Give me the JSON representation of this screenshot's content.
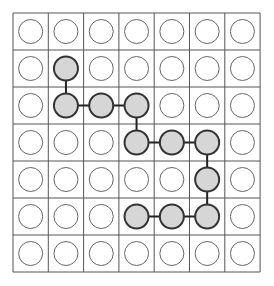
{
  "grid": {
    "rows": 7,
    "cols": 7,
    "origin_x": 13,
    "origin_y": 13,
    "cell_width": 35.3,
    "cell_height": 37,
    "line_color": "#555555",
    "line_width": 1
  },
  "circles": {
    "radius": 12,
    "empty_fill": "#ffffff",
    "empty_stroke": "#666666",
    "empty_stroke_width": 1,
    "filled_fill": "#d6d6d6",
    "filled_stroke": "#333333",
    "filled_stroke_width": 2
  },
  "connector": {
    "color": "#222222",
    "width": 2
  },
  "path": [
    [
      1,
      1
    ],
    [
      2,
      1
    ],
    [
      2,
      2
    ],
    [
      2,
      3
    ],
    [
      3,
      3
    ],
    [
      3,
      4
    ],
    [
      3,
      5
    ],
    [
      4,
      5
    ],
    [
      5,
      5
    ],
    [
      5,
      4
    ],
    [
      5,
      3
    ]
  ]
}
